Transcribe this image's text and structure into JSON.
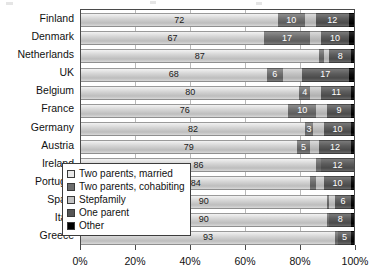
{
  "chart_data": {
    "type": "bar",
    "title": "",
    "subtitle": "",
    "xlabel": "",
    "ylabel": "",
    "orientation": "horizontal",
    "stacked": true,
    "stack_mode": "percent",
    "grid": true,
    "legend_position": "inside-lower-left",
    "xlim": [
      0,
      100
    ],
    "xticks": [
      0,
      20,
      40,
      60,
      80,
      100
    ],
    "xticklabels": [
      "0%",
      "20%",
      "40%",
      "60%",
      "80%",
      "100%"
    ],
    "categories": [
      "Finland",
      "Denmark",
      "Netherlands",
      "UK",
      "Belgium",
      "France",
      "Germany",
      "Austria",
      "Ireland",
      "Portugal",
      "Spain",
      "Italy",
      "Greece"
    ],
    "series": [
      {
        "name": "Two parents, married",
        "values": [
          72,
          67,
          87,
          68,
          80,
          76,
          82,
          79,
          86,
          84,
          90,
          90,
          93
        ]
      },
      {
        "name": "Two parents, cohabiting",
        "values": [
          10,
          17,
          2,
          6,
          4,
          10,
          3,
          5,
          2,
          2,
          1,
          1,
          1
        ]
      },
      {
        "name": "Stepfamily",
        "values": [
          4,
          4,
          2,
          7,
          4,
          4,
          4,
          3,
          0,
          3,
          2,
          0,
          0
        ]
      },
      {
        "name": "One parent",
        "values": [
          12,
          10,
          8,
          17,
          11,
          9,
          10,
          12,
          12,
          10,
          6,
          8,
          5
        ]
      },
      {
        "name": "Other",
        "values": [
          2,
          2,
          1,
          2,
          1,
          1,
          1,
          1,
          0,
          1,
          1,
          1,
          1
        ]
      }
    ],
    "data_labels": {
      "Finland": [
        "72",
        "10",
        "",
        "12",
        ""
      ],
      "Denmark": [
        "67",
        "17",
        "",
        "10",
        ""
      ],
      "Netherlands": [
        "87",
        "",
        "",
        "8",
        ""
      ],
      "UK": [
        "68",
        "6",
        "",
        "17",
        ""
      ],
      "Belgium": [
        "80",
        "4",
        "",
        "11",
        ""
      ],
      "France": [
        "76",
        "10",
        "",
        "9",
        ""
      ],
      "Germany": [
        "82",
        "3",
        "",
        "10",
        ""
      ],
      "Austria": [
        "79",
        "5",
        "",
        "12",
        ""
      ],
      "Ireland": [
        "86",
        "",
        "",
        "12",
        ""
      ],
      "Portugal": [
        "84",
        "",
        "",
        "10",
        ""
      ],
      "Spain": [
        "90",
        "",
        "",
        "6",
        ""
      ],
      "Italy": [
        "90",
        "",
        "",
        "8",
        ""
      ],
      "Greece": [
        "93",
        "",
        "",
        "5",
        ""
      ]
    },
    "legend": [
      "Two parents, married",
      "Two parents, cohabiting",
      "Stepfamily",
      "One parent",
      "Other"
    ],
    "colors": [
      "#d4d4d4",
      "#6f6f6f",
      "#c2c2c2",
      "#5c5c5c",
      "#000000"
    ]
  }
}
